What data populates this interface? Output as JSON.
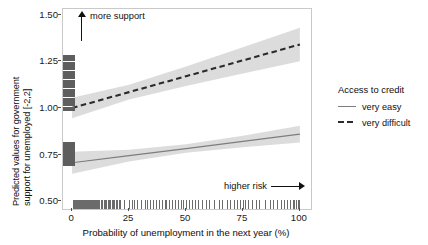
{
  "chart_data": {
    "type": "line",
    "title": "",
    "xlabel": "Probability of unemployment in the next year (%)",
    "ylabel_line1": "Predicted values for government",
    "ylabel_line2": "support for unemployed [-2,2]",
    "xlim": [
      0,
      100
    ],
    "ylim": [
      0.5,
      1.5
    ],
    "xticks": [
      "0",
      "25",
      "50",
      "75",
      "100"
    ],
    "xtick_values": [
      0,
      25,
      50,
      75,
      100
    ],
    "yticks": [
      "0.50",
      "0.75",
      "1.00",
      "1.25",
      "1.50"
    ],
    "ytick_values": [
      0.5,
      0.75,
      1.0,
      1.25,
      1.5
    ],
    "grid": false,
    "legend_position": "right",
    "annotations": [
      {
        "name": "more-support",
        "text": "more support",
        "arrow": "up"
      },
      {
        "name": "higher-risk",
        "text": "higher risk",
        "arrow": "right"
      }
    ],
    "series": [
      {
        "name": "very easy",
        "style": "solid",
        "color": "#7d7d7d",
        "x": [
          0,
          25,
          50,
          75,
          100
        ],
        "values": [
          0.707,
          0.745,
          0.783,
          0.821,
          0.86
        ],
        "ci_lower": [
          0.648,
          0.713,
          0.76,
          0.79,
          0.815
        ],
        "ci_upper": [
          0.766,
          0.777,
          0.806,
          0.852,
          0.905
        ]
      },
      {
        "name": "very difficult",
        "style": "dashed",
        "color": "#2b2b2b",
        "x": [
          0,
          25,
          50,
          75,
          100
        ],
        "values": [
          1.0,
          1.085,
          1.17,
          1.255,
          1.34
        ],
        "ci_lower": [
          0.945,
          1.045,
          1.118,
          1.185,
          1.25
        ],
        "ci_upper": [
          1.055,
          1.125,
          1.222,
          1.325,
          1.43
        ]
      }
    ],
    "ribbon_color": "#d6d6d6",
    "x_rug_values": [
      0.4,
      0.8,
      1.2,
      1.7,
      2.1,
      2.5,
      3.0,
      3.4,
      3.8,
      4.3,
      4.7,
      5.1,
      5.6,
      6.0,
      6.4,
      6.9,
      7.3,
      7.7,
      8.2,
      8.6,
      9.0,
      9.5,
      9.9,
      10.4,
      10.9,
      11.4,
      12.0,
      12.6,
      13.2,
      13.8,
      14.4,
      15.0,
      15.6,
      16.2,
      16.8,
      17.4,
      18.0,
      18.6,
      19.2,
      19.8,
      20.4,
      21.0,
      22.6,
      24.8,
      26.1,
      27.3,
      28.5,
      30.2,
      31.9,
      33.0,
      34.4,
      35.6,
      36.9,
      38.1,
      39.4,
      40.6,
      41.2,
      42.6,
      43.8,
      45.1,
      46.4,
      47.6,
      48.8,
      50.1,
      51.3,
      52.6,
      53.9,
      55.4,
      57.0,
      58.6,
      60.0,
      62.4,
      64.6,
      66.0,
      67.9,
      69.4,
      71.0,
      72.3,
      73.6,
      74.9,
      76.1,
      77.4,
      79.0,
      80.6,
      82.0,
      84.5,
      86.8,
      88.4,
      90.1,
      91.6,
      93.0,
      94.4,
      95.8,
      96.8,
      97.6,
      98.4,
      99.2,
      99.8
    ],
    "y_rug_values": [
      1.285,
      1.272,
      1.26,
      1.248,
      1.236,
      1.224,
      1.212,
      1.2,
      1.188,
      1.176,
      1.164,
      1.152,
      1.14,
      1.128,
      1.116,
      1.104,
      1.092,
      1.08,
      1.068,
      1.056,
      1.044,
      1.032,
      1.02,
      1.008,
      0.996,
      0.82,
      0.81,
      0.8,
      0.79,
      0.78,
      0.77,
      0.76,
      0.75,
      0.74,
      0.73,
      0.72,
      0.71,
      0.7
    ]
  },
  "legend": {
    "title": "Access to credit",
    "items": [
      {
        "label": "very easy",
        "style": "solid"
      },
      {
        "label": "very difficult",
        "style": "dashed"
      }
    ]
  }
}
